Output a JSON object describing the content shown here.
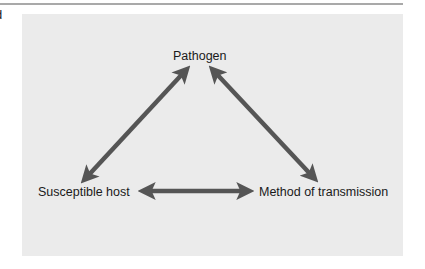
{
  "page": {
    "edge_glyph": "d"
  },
  "diagram": {
    "type": "triangle-relationship",
    "nodes": [
      {
        "id": "pathogen",
        "label": "Pathogen"
      },
      {
        "id": "susceptible_host",
        "label": "Susceptible host"
      },
      {
        "id": "method_of_transmission",
        "label": "Method of transmission"
      }
    ],
    "edges": [
      {
        "from": "pathogen",
        "to": "susceptible_host",
        "direction": "bidirectional"
      },
      {
        "from": "pathogen",
        "to": "method_of_transmission",
        "direction": "bidirectional"
      },
      {
        "from": "susceptible_host",
        "to": "method_of_transmission",
        "direction": "bidirectional"
      }
    ],
    "colors": {
      "panel": "#ebebeb",
      "arrow": "#555555",
      "text": "#1a1a1a",
      "rule": "#a9a9a9"
    }
  }
}
